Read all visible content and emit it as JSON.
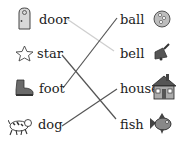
{
  "left_words": [
    {
      "label": "door",
      "icon": "door-icon"
    },
    {
      "label": "star",
      "icon": "star-icon"
    },
    {
      "label": "foot",
      "icon": "boot-icon"
    },
    {
      "label": "dog",
      "icon": "dog-icon"
    }
  ],
  "right_words": [
    {
      "label": "ball",
      "icon": "ball-icon"
    },
    {
      "label": "bell",
      "icon": "bell-icon"
    },
    {
      "label": "house",
      "icon": "house-icon"
    },
    {
      "label": "fish",
      "icon": "fish-icon"
    }
  ],
  "connections": [
    {
      "from": "door",
      "to": "bell",
      "color": "#cfcfcf"
    },
    {
      "from": "star",
      "to": "fish",
      "color": "#555555"
    },
    {
      "from": "foot",
      "to": "ball",
      "color": "#555555"
    },
    {
      "from": "dog",
      "to": "house",
      "color": "#555555"
    }
  ]
}
